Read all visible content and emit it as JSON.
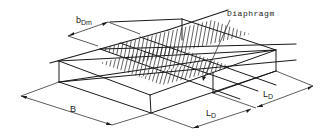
{
  "figure": {
    "type": "isometric structural sketch",
    "labels": {
      "diaphragm": "Diaphragm",
      "b_dm_main": "b",
      "b_dm_sub": "Dm",
      "b_width": "B",
      "l_d_1_main": "L",
      "l_d_1_sub": "D",
      "l_d_2_main": "L",
      "l_d_2_sub": "D"
    },
    "colors": {
      "line": "#1a1a1a",
      "background": "#ffffff"
    }
  }
}
